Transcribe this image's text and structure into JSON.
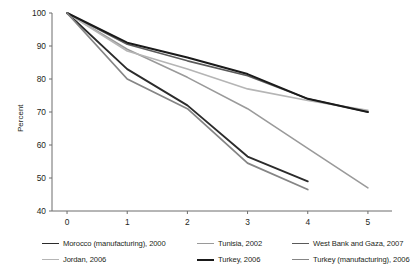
{
  "chart": {
    "ylabel": "Percent",
    "xlabel": "",
    "title": ""
  },
  "chart_data": {
    "type": "line",
    "title": "",
    "subtitle": "",
    "xlabel": "",
    "ylabel": "Percent",
    "xlim": [
      -0.25,
      5.4
    ],
    "ylim": [
      40,
      100
    ],
    "xticks": [
      0,
      1,
      2,
      3,
      4,
      5
    ],
    "yticks": [
      40,
      50,
      60,
      70,
      80,
      90,
      100
    ],
    "xtick_labels": [
      "0",
      "1",
      "2",
      "3",
      "4",
      "5"
    ],
    "ytick_labels": [
      "40",
      "50",
      "60",
      "70",
      "80",
      "90",
      "100"
    ],
    "grid": false,
    "legend_position": "bottom",
    "series": [
      {
        "name": "Morocco (manufacturing), 2000",
        "color": "#2b2b2b",
        "width": 1.9,
        "x": [
          0,
          1,
          2,
          3,
          4
        ],
        "values": [
          100,
          83,
          72,
          56.5,
          49
        ]
      },
      {
        "name": "Tunisia, 2002",
        "color": "#9a9a9a",
        "width": 1.6,
        "x": [
          0,
          1,
          2,
          3,
          4,
          5
        ],
        "values": [
          100,
          89,
          80.5,
          71,
          59,
          47
        ]
      },
      {
        "name": "West Bank and Gaza, 2007",
        "color": "#5a5a5a",
        "width": 1.6,
        "x": [
          0,
          1,
          2,
          3,
          4,
          5
        ],
        "values": [
          100,
          90.5,
          85.5,
          81,
          74,
          70
        ]
      },
      {
        "name": "Jordan, 2006",
        "color": "#b5b5b5",
        "width": 1.6,
        "x": [
          0,
          1,
          2,
          3,
          4,
          5
        ],
        "values": [
          100,
          88.5,
          83,
          77,
          73.5,
          70.5
        ]
      },
      {
        "name": "Turkey, 2006",
        "color": "#1a1a1a",
        "width": 2.0,
        "x": [
          0,
          1,
          2,
          3,
          4,
          5
        ],
        "values": [
          100,
          91,
          86.5,
          81.5,
          74,
          70
        ]
      },
      {
        "name": "Turkey (manufacturing), 2006",
        "color": "#858585",
        "width": 1.8,
        "x": [
          0,
          1,
          2,
          3,
          4
        ],
        "values": [
          100,
          80,
          71,
          54.5,
          46.5
        ]
      }
    ]
  },
  "legend": {
    "rows": [
      [
        {
          "label": "Morocco (manufacturing), 2000",
          "color": "#2b2b2b",
          "width": 1.9
        },
        {
          "label": "Tunisia, 2002",
          "color": "#9a9a9a",
          "width": 1.6
        },
        {
          "label": "West Bank and Gaza, 2007",
          "color": "#5a5a5a",
          "width": 1.6
        }
      ],
      [
        {
          "label": "Jordan, 2006",
          "color": "#b5b5b5",
          "width": 1.6
        },
        {
          "label": "Turkey, 2006",
          "color": "#1a1a1a",
          "width": 2.0
        },
        {
          "label": "Turkey (manufacturing), 2006",
          "color": "#858585",
          "width": 1.8
        }
      ]
    ]
  },
  "colors": {
    "axis": "#6d6d6d",
    "text": "#231f20",
    "background": "#ffffff"
  }
}
